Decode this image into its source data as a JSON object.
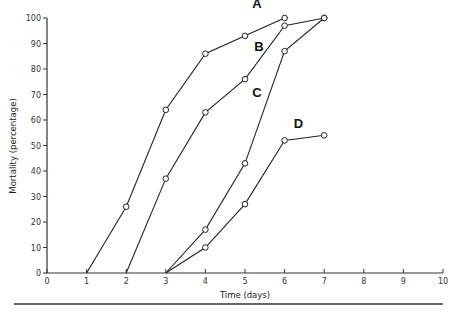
{
  "chart_data": {
    "type": "line",
    "title": "",
    "xlabel": "Time (days)",
    "ylabel": "Mortality (percentage)",
    "xlim": [
      0,
      10
    ],
    "ylim": [
      0,
      100
    ],
    "x_ticks": [
      "0",
      "1",
      "2",
      "3",
      "4",
      "5",
      "6",
      "7",
      "8",
      "9",
      "10"
    ],
    "y_ticks": [
      "0",
      "10",
      "20",
      "30",
      "40",
      "50",
      "60",
      "70",
      "80",
      "90",
      "100"
    ],
    "grid": false,
    "legend": "inline labels",
    "series": [
      {
        "name": "A",
        "points": [
          [
            1,
            0
          ],
          [
            2,
            26
          ],
          [
            3,
            64
          ],
          [
            4,
            86
          ],
          [
            5,
            93
          ],
          [
            6,
            100
          ]
        ],
        "marker_from_index": 1,
        "label_pos": [
          5.3,
          104
        ]
      },
      {
        "name": "B",
        "points": [
          [
            2,
            0
          ],
          [
            3,
            37
          ],
          [
            4,
            63
          ],
          [
            5,
            76
          ],
          [
            6,
            97
          ],
          [
            7,
            100
          ]
        ],
        "marker_from_index": 1,
        "label_pos": [
          5.35,
          87
        ]
      },
      {
        "name": "C",
        "points": [
          [
            3,
            0
          ],
          [
            4,
            17
          ],
          [
            5,
            43
          ],
          [
            6,
            87
          ],
          [
            7,
            100
          ]
        ],
        "marker_from_index": 1,
        "label_pos": [
          5.3,
          69
        ]
      },
      {
        "name": "D",
        "points": [
          [
            3,
            0
          ],
          [
            4,
            10
          ],
          [
            5,
            27
          ],
          [
            6,
            52
          ],
          [
            7,
            54
          ]
        ],
        "marker_from_index": 1,
        "label_pos": [
          6.35,
          57
        ]
      }
    ]
  }
}
